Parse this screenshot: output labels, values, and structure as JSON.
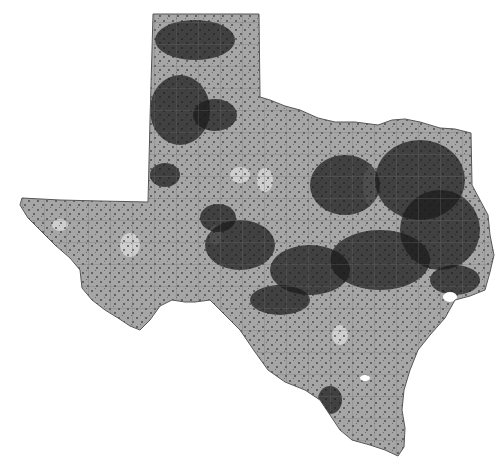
{
  "map": {
    "type": "choropleth-density",
    "region": "Texas",
    "subdivisions": "counties",
    "colors": {
      "background": "#ffffff",
      "land": "#a6a6a6",
      "county_lines": "#6e6e6e",
      "light_patches": "#d4d4d4",
      "dense_points": "#1a1a1a",
      "outline": "#555555",
      "water": "#ffffff"
    },
    "outline_points": [
      [
        153,
        14
      ],
      [
        259,
        14
      ],
      [
        260,
        97
      ],
      [
        270,
        100
      ],
      [
        285,
        106
      ],
      [
        300,
        110
      ],
      [
        318,
        118
      ],
      [
        335,
        122
      ],
      [
        355,
        122
      ],
      [
        378,
        125
      ],
      [
        392,
        120
      ],
      [
        405,
        119
      ],
      [
        420,
        122
      ],
      [
        440,
        128
      ],
      [
        455,
        129
      ],
      [
        471,
        133
      ],
      [
        472,
        185
      ],
      [
        480,
        200
      ],
      [
        488,
        215
      ],
      [
        490,
        235
      ],
      [
        494,
        255
      ],
      [
        490,
        272
      ],
      [
        485,
        290
      ],
      [
        470,
        296
      ],
      [
        455,
        300
      ],
      [
        445,
        318
      ],
      [
        430,
        335
      ],
      [
        418,
        350
      ],
      [
        410,
        370
      ],
      [
        404,
        390
      ],
      [
        402,
        410
      ],
      [
        405,
        428
      ],
      [
        404,
        447
      ],
      [
        398,
        456
      ],
      [
        385,
        450
      ],
      [
        370,
        445
      ],
      [
        352,
        440
      ],
      [
        340,
        430
      ],
      [
        330,
        415
      ],
      [
        320,
        400
      ],
      [
        305,
        390
      ],
      [
        285,
        382
      ],
      [
        268,
        370
      ],
      [
        255,
        352
      ],
      [
        240,
        330
      ],
      [
        228,
        318
      ],
      [
        210,
        300
      ],
      [
        195,
        302
      ],
      [
        185,
        302
      ],
      [
        172,
        300
      ],
      [
        160,
        306
      ],
      [
        150,
        320
      ],
      [
        140,
        330
      ],
      [
        130,
        326
      ],
      [
        118,
        318
      ],
      [
        105,
        310
      ],
      [
        92,
        300
      ],
      [
        82,
        288
      ],
      [
        80,
        270
      ],
      [
        70,
        258
      ],
      [
        55,
        245
      ],
      [
        40,
        230
      ],
      [
        28,
        218
      ],
      [
        20,
        205
      ],
      [
        22,
        198
      ],
      [
        60,
        200
      ],
      [
        100,
        201
      ],
      [
        148,
        202
      ],
      [
        150,
        120
      ],
      [
        153,
        14
      ]
    ],
    "dense_clusters": [
      {
        "cx": 195,
        "cy": 40,
        "rx": 40,
        "ry": 20
      },
      {
        "cx": 180,
        "cy": 110,
        "rx": 30,
        "ry": 35
      },
      {
        "cx": 215,
        "cy": 115,
        "rx": 22,
        "ry": 16
      },
      {
        "cx": 165,
        "cy": 175,
        "rx": 15,
        "ry": 12
      },
      {
        "cx": 218,
        "cy": 218,
        "rx": 18,
        "ry": 14
      },
      {
        "cx": 240,
        "cy": 245,
        "rx": 35,
        "ry": 25
      },
      {
        "cx": 345,
        "cy": 185,
        "rx": 35,
        "ry": 30
      },
      {
        "cx": 420,
        "cy": 180,
        "rx": 45,
        "ry": 40
      },
      {
        "cx": 440,
        "cy": 230,
        "rx": 40,
        "ry": 40
      },
      {
        "cx": 380,
        "cy": 260,
        "rx": 50,
        "ry": 30
      },
      {
        "cx": 310,
        "cy": 270,
        "rx": 40,
        "ry": 25
      },
      {
        "cx": 455,
        "cy": 280,
        "rx": 25,
        "ry": 15
      },
      {
        "cx": 330,
        "cy": 400,
        "rx": 12,
        "ry": 14
      },
      {
        "cx": 280,
        "cy": 300,
        "rx": 30,
        "ry": 15
      }
    ],
    "light_patches": [
      {
        "cx": 240,
        "cy": 175,
        "rx": 10,
        "ry": 8
      },
      {
        "cx": 265,
        "cy": 180,
        "rx": 8,
        "ry": 12
      },
      {
        "cx": 130,
        "cy": 245,
        "rx": 10,
        "ry": 12
      },
      {
        "cx": 370,
        "cy": 185,
        "rx": 7,
        "ry": 20
      },
      {
        "cx": 215,
        "cy": 235,
        "rx": 6,
        "ry": 10
      },
      {
        "cx": 60,
        "cy": 225,
        "rx": 8,
        "ry": 6
      },
      {
        "cx": 340,
        "cy": 335,
        "rx": 8,
        "ry": 10
      }
    ],
    "water_bodies": [
      {
        "name": "galveston-bay",
        "cx": 450,
        "cy": 297,
        "rx": 7,
        "ry": 5
      },
      {
        "name": "corpus-christi-bay",
        "cx": 365,
        "cy": 378,
        "rx": 5,
        "ry": 3
      }
    ]
  }
}
